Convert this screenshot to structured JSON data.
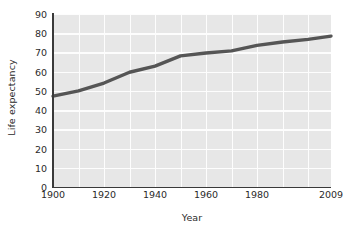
{
  "chart_data": {
    "type": "line",
    "title": "",
    "xlabel": "Year",
    "ylabel": "Life expectancy",
    "xlim": [
      1900,
      2009
    ],
    "ylim": [
      0,
      90
    ],
    "grid": true,
    "legend": false,
    "legend_position": "none",
    "line_color": "#555555",
    "plot_background": "#e7e7e7",
    "gridline_color": "#fdfdfd",
    "axis_color": "#3a3a3a",
    "text_color": "#2b2b2b",
    "x_ticks": [
      "1900",
      "1920",
      "1940",
      "1960",
      "1980",
      "2009"
    ],
    "x_tick_values": [
      1900,
      1920,
      1940,
      1960,
      1980,
      2009
    ],
    "y_ticks": [
      "0",
      "10",
      "20",
      "30",
      "40",
      "50",
      "60",
      "70",
      "80",
      "90"
    ],
    "y_tick_values": [
      0,
      10,
      20,
      30,
      40,
      50,
      60,
      70,
      80,
      90
    ],
    "series": [
      {
        "name": "Life expectancy",
        "x": [
          1900,
          1910,
          1920,
          1930,
          1940,
          1950,
          1960,
          1970,
          1980,
          1990,
          2000,
          2009
        ],
        "values": [
          47.3,
          50.0,
          54.1,
          59.7,
          62.9,
          68.2,
          69.7,
          70.8,
          73.7,
          75.4,
          76.8,
          78.5
        ]
      }
    ]
  }
}
